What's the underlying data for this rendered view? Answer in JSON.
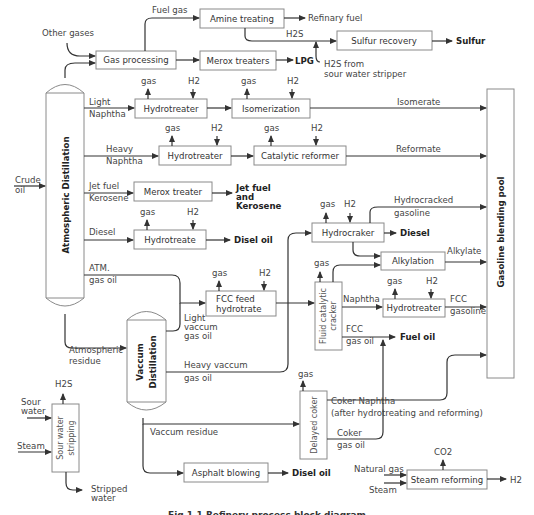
{
  "diagram": {
    "columns": {
      "atmospheric": "Atmospheric Distillation",
      "vacuum_line1": "Vaccum",
      "vacuum_line2": "Distillation",
      "blending_pool": "Gasoline blending pool"
    },
    "units": {
      "amine_treating": "Amine treating",
      "gas_processing": "Gas processing",
      "merox_treaters": "Merox treaters",
      "sulfur_recovery": "Sulfur recovery",
      "hydrotreater_light": "Hydrotreater",
      "isomerization": "Isomerization",
      "hydrotreater_heavy": "Hydrotreater",
      "catalytic_reformer": "Catalytic reformer",
      "merox_treater": "Merox treater",
      "hydrotreate_diesel": "Hydrotreate",
      "hydrocraker": "Hydrocraker",
      "alkylation": "Alkylation",
      "fcc_feed_line1": "FCC feed",
      "fcc_feed_line2": "hydrotrate",
      "fcc_line1": "Fluid catalytic",
      "fcc_line2": "cracker",
      "hydrotreater_fcc": "Hydrotreater",
      "delayed_coker": "Delayed coker",
      "sour_water_line1": "Sour water",
      "sour_water_line2": "stripping",
      "asphalt_blowing": "Asphalt blowing",
      "steam_reforming": "Steam reforming"
    },
    "streams": {
      "fuel_gas": "Fuel gas",
      "other_gases": "Other gases",
      "refinary_fuel": "Refinary fuel",
      "h2s": "H2S",
      "h2s_from_line1": "H2S from",
      "h2s_from_line2": "sour water stripper",
      "light": "Light",
      "naphtha": "Naphtha",
      "heavy": "Heavy",
      "isomerate": "Isomerate",
      "reformate": "Reformate",
      "crude_line1": "Crude",
      "crude_line2": "oil",
      "jet_fuel": "Jet fuel",
      "kerosene": "Kerosene",
      "diesel": "Diesel",
      "atm_line1": "ATM.",
      "atm_line2": "gas oil",
      "hydrocracked_line1": "Hydrocracked",
      "hydrocracked_line2": "gasoline",
      "alkylate": "Alkylate",
      "lvgo_line1": "Light",
      "lvgo_line2": "vaccum",
      "lvgo_line3": "gas oil",
      "fcc_naphtha": "Naphtha",
      "fcc_gasoline_line1": "FCC",
      "fcc_gasoline_line2": "gasoline",
      "fcc_gasoil_line1": "FCC",
      "fcc_gasoil_line2": "gas oil",
      "atm_residue_line1": "Atmospheric",
      "atm_residue_line2": "residue",
      "hvgo_line1": "Heavy vaccum",
      "hvgo_line2": "gas oil",
      "sour_line1": "Sour",
      "sour_line2": "water",
      "steam": "Steam",
      "vaccum_residue": "Vaccum residue",
      "coker_naphtha_line1": "Coker Naphtha",
      "coker_naphtha_line2": "(after hydrotreating and reforming)",
      "coker_gasoil_line1": "Coker",
      "coker_gasoil_line2": "gas oil",
      "stripped_line1": "Stripped",
      "stripped_line2": "water",
      "natural_gas": "Natural gas",
      "co2": "CO2",
      "h2": "H2",
      "gas": "gas"
    },
    "products": {
      "sulfur": "Sulfur",
      "lpg": "LPG",
      "jet_line1": "Jet fuel",
      "jet_line2": "and",
      "jet_line3": "Kerosene",
      "disel_oil": "Disel oil",
      "diesel": "Diesel",
      "fuel_oil": "Fuel oil"
    },
    "caption": "Fig 1.1 Refinery process block diagram"
  }
}
